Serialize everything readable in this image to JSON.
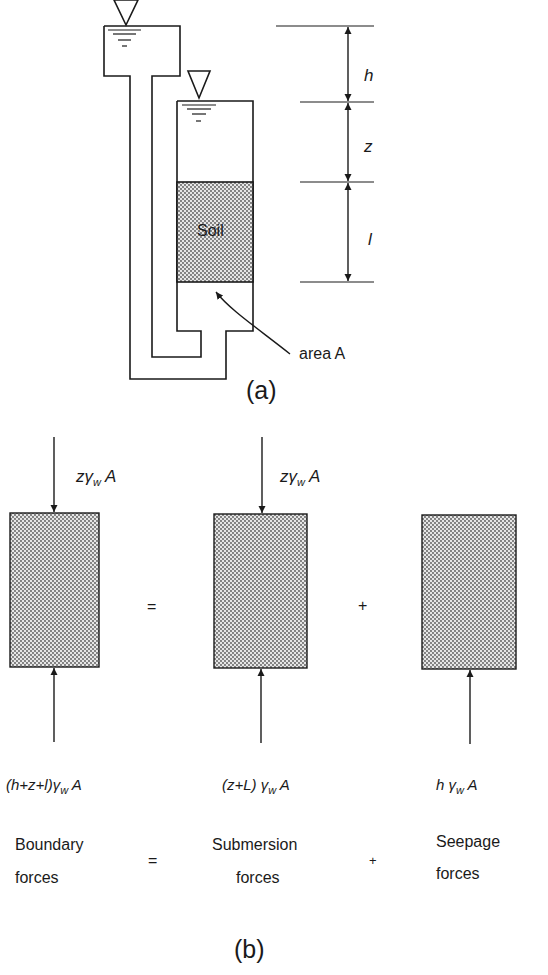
{
  "figure_a": {
    "caption": "(a)",
    "soil_label": "Soil",
    "area_label": "area A",
    "dimensions": [
      {
        "label": "h"
      },
      {
        "label": "z"
      },
      {
        "label": "l"
      }
    ]
  },
  "figure_b": {
    "caption": "(b)",
    "operators": {
      "equals": "=",
      "plus": "+"
    },
    "blocks": [
      {
        "top_force": "zγ",
        "top_force_sub": "w",
        "top_force_tail": " A",
        "bottom_force": "(h+z+l)γ",
        "bottom_force_sub": "w",
        "bottom_force_tail": " A",
        "name_line1": "Boundary",
        "name_line2": "forces"
      },
      {
        "top_force": "zγ",
        "top_force_sub": "w",
        "top_force_tail": " A",
        "bottom_force": "(z+L) γ",
        "bottom_force_sub": "w",
        "bottom_force_tail": " A",
        "name_line1": "Submersion",
        "name_line2": "forces"
      },
      {
        "top_force": "",
        "bottom_force": "h γ",
        "bottom_force_sub": "w",
        "bottom_force_tail": " A",
        "name_line1": "Seepage",
        "name_line2": "forces"
      }
    ]
  },
  "colors": {
    "ink": "#1a1a1a",
    "soil_fill": "#bdbdbd",
    "background": "#ffffff"
  }
}
